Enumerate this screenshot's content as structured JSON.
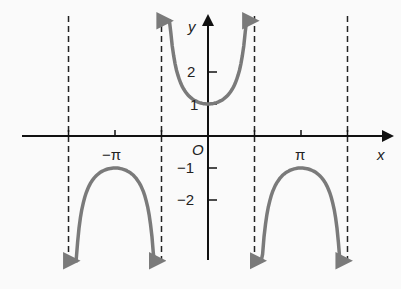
{
  "chart_data": {
    "type": "line",
    "title": "",
    "function": "y = sec x",
    "xlabel": "x",
    "ylabel": "y",
    "origin_label": "O",
    "x_ticks": [
      {
        "value": -3.14159,
        "label": "−π"
      },
      {
        "value": 3.14159,
        "label": "π"
      }
    ],
    "y_ticks": [
      {
        "value": 2,
        "label": "2"
      },
      {
        "value": 1,
        "label": "1"
      },
      {
        "value": -1,
        "label": "−1"
      },
      {
        "value": -2,
        "label": "−2"
      }
    ],
    "asymptotes": [
      -4.712,
      -1.5708,
      1.5708,
      4.712
    ],
    "series": [
      {
        "name": "branch-left",
        "x_range": [
          -4.6,
          -1.7
        ],
        "vertex": [
          -3.14159,
          -1
        ]
      },
      {
        "name": "branch-center",
        "x_range": [
          -1.45,
          1.45
        ],
        "vertex": [
          0,
          1
        ]
      },
      {
        "name": "branch-right",
        "x_range": [
          1.7,
          4.6
        ],
        "vertex": [
          3.14159,
          -1
        ]
      }
    ],
    "grid": false,
    "legend": false,
    "curve_color": "#7a7a7a",
    "axis_color": "#111111"
  },
  "labels": {
    "x": "x",
    "y": "y",
    "origin": "O",
    "neg_pi": "−π",
    "pi": "π",
    "y2": "2",
    "y1": "1",
    "yn1": "−1",
    "yn2": "−2"
  }
}
